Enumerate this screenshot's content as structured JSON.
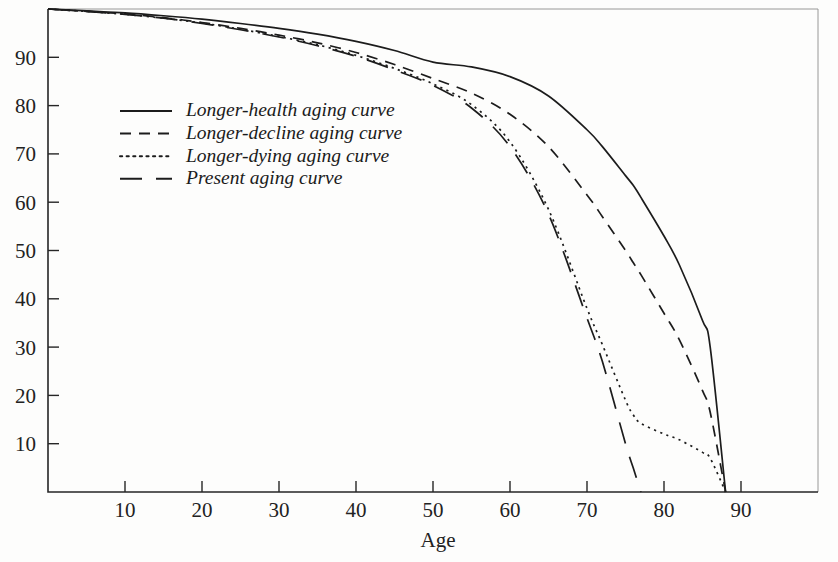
{
  "figure": {
    "background_color": "#fdfdfc",
    "line_color": "#1c1c1c",
    "axis_color": "#262626"
  },
  "axes": {
    "x_title": "Age",
    "y_title": "",
    "x_ticks": [
      10,
      20,
      30,
      40,
      50,
      60,
      70,
      80,
      90
    ],
    "y_ticks": [
      10,
      20,
      30,
      40,
      50,
      60,
      70,
      80,
      90
    ],
    "x_tick_labels": [
      "10",
      "20",
      "30",
      "40",
      "50",
      "60",
      "70",
      "80",
      "90"
    ],
    "y_tick_labels": [
      "10",
      "20",
      "30",
      "40",
      "50",
      "60",
      "70",
      "80",
      "90"
    ],
    "xlim": [
      0,
      100
    ],
    "ylim": [
      0,
      100
    ],
    "grid": false
  },
  "legend": {
    "position": "upper-left-inside",
    "entries": [
      {
        "label": "Longer-health aging curve",
        "style": "solid",
        "dash": "none"
      },
      {
        "label": "Longer-decline aging curve",
        "style": "dashed",
        "dash": "11,8"
      },
      {
        "label": "Longer-dying aging curve",
        "style": "dotted",
        "dash": "2.2,4.4"
      },
      {
        "label": "Present aging curve",
        "style": "long-dashed",
        "dash": "22,14"
      }
    ]
  },
  "chart_data": {
    "type": "line",
    "title": "",
    "xlabel": "Age",
    "ylabel": "",
    "xlim": [
      0,
      100
    ],
    "ylim": [
      0,
      100
    ],
    "grid": false,
    "x": [
      0,
      5,
      10,
      15,
      20,
      25,
      30,
      35,
      40,
      45,
      50,
      55,
      60,
      65,
      70,
      72,
      75,
      76,
      77,
      80,
      82,
      85,
      86,
      88
    ],
    "series": [
      {
        "name": "Longer-health aging curve",
        "style": "solid",
        "values": [
          100,
          99.6,
          99.2,
          98.6,
          97.9,
          97.0,
          96.0,
          94.8,
          93.3,
          91.4,
          89.0,
          88.0,
          86.0,
          82.0,
          75.0,
          71.5,
          65.5,
          63.5,
          61.0,
          53.0,
          47.0,
          35.5,
          30.0,
          0
        ]
      },
      {
        "name": "Longer-decline aging curve",
        "style": "dashed",
        "values": [
          100,
          99.5,
          99.0,
          98.2,
          97.2,
          96.0,
          94.6,
          93.0,
          91.0,
          88.5,
          85.6,
          82.6,
          78.2,
          71.5,
          61.5,
          57.0,
          50.0,
          47.5,
          45.0,
          37.0,
          31.5,
          21.0,
          16.5,
          0
        ]
      },
      {
        "name": "Longer-dying aging curve",
        "style": "dotted",
        "values": [
          100,
          99.5,
          98.9,
          98.1,
          97.1,
          95.8,
          94.3,
          92.6,
          90.4,
          87.7,
          84.5,
          80.2,
          72.5,
          58.5,
          38.0,
          30.5,
          19.0,
          16.0,
          14.2,
          12.0,
          10.8,
          8.2,
          7.0,
          0
        ]
      },
      {
        "name": "Present aging curve",
        "style": "long-dashed",
        "values": [
          100,
          99.5,
          98.9,
          98.1,
          97.0,
          95.7,
          94.2,
          92.4,
          90.2,
          87.4,
          84.2,
          79.5,
          71.5,
          57.5,
          36.0,
          27.0,
          10.0,
          5.0,
          0,
          null,
          null,
          null,
          null,
          null
        ]
      }
    ]
  }
}
